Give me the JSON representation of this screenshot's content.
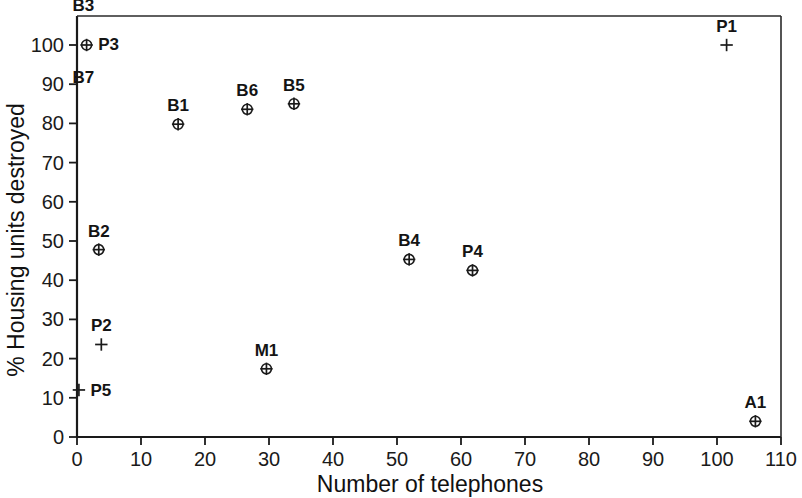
{
  "chart_data": {
    "type": "scatter",
    "title": "",
    "xlabel": "Number of telephones",
    "ylabel": "% Housing units destroyed",
    "xlim": [
      0,
      110
    ],
    "ylim": [
      0,
      105
    ],
    "xticks": [
      "0",
      "10",
      "20",
      "30",
      "40",
      "50",
      "60",
      "70",
      "80",
      "90",
      "100",
      "110"
    ],
    "xtick_values": [
      0,
      10,
      20,
      30,
      40,
      50,
      60,
      70,
      80,
      90,
      100,
      110
    ],
    "yticks": [
      "0",
      "10",
      "20",
      "30",
      "40",
      "50",
      "60",
      "70",
      "80",
      "90",
      "100"
    ],
    "ytick_values": [
      0,
      10,
      20,
      30,
      40,
      50,
      60,
      70,
      80,
      90,
      100
    ],
    "grid": false,
    "legend": "none",
    "marker_types": {
      "circle_plus": "circle with plus inside",
      "plus": "plus sign"
    },
    "points": [
      {
        "label": "B3",
        "x": 1.0,
        "y": 102.0,
        "marker": "none",
        "label_dx": 0,
        "label_dy": -26
      },
      {
        "label": "P3",
        "x": 1.5,
        "y": 100.0,
        "marker": "circle_plus",
        "label_dx": 22,
        "label_dy": 5
      },
      {
        "label": "B7",
        "x": 1.0,
        "y": 96.0,
        "marker": "none",
        "label_dx": 0,
        "label_dy": 22
      },
      {
        "label": "B1",
        "x": 15.8,
        "y": 79.8,
        "marker": "circle_plus",
        "label_dx": 0,
        "label_dy": -13
      },
      {
        "label": "B6",
        "x": 26.6,
        "y": 83.6,
        "marker": "circle_plus",
        "label_dx": 0,
        "label_dy": -13
      },
      {
        "label": "B5",
        "x": 33.9,
        "y": 85.0,
        "marker": "circle_plus",
        "label_dx": 0,
        "label_dy": -13
      },
      {
        "label": "P1",
        "x": 101.5,
        "y": 100.0,
        "marker": "plus",
        "label_dx": 0,
        "label_dy": -13
      },
      {
        "label": "B2",
        "x": 3.4,
        "y": 47.8,
        "marker": "circle_plus",
        "label_dx": 0,
        "label_dy": -13
      },
      {
        "label": "B4",
        "x": 51.9,
        "y": 45.3,
        "marker": "circle_plus",
        "label_dx": 0,
        "label_dy": -13
      },
      {
        "label": "P4",
        "x": 61.8,
        "y": 42.5,
        "marker": "circle_plus",
        "label_dx": 0,
        "label_dy": -13
      },
      {
        "label": "P2",
        "x": 3.8,
        "y": 23.6,
        "marker": "plus",
        "label_dx": 0,
        "label_dy": -13
      },
      {
        "label": "M1",
        "x": 29.6,
        "y": 17.4,
        "marker": "circle_plus",
        "label_dx": 0,
        "label_dy": -13
      },
      {
        "label": "P5",
        "x": 0.3,
        "y": 12.0,
        "marker": "plus",
        "label_dx": 22,
        "label_dy": 6
      },
      {
        "label": "A1",
        "x": 106.0,
        "y": 4.0,
        "marker": "circle_plus",
        "label_dx": 0,
        "label_dy": -13
      }
    ]
  },
  "colors": {
    "axis": "#1a1a1a",
    "marker": "#1a1a1a",
    "text": "#111111",
    "background": "#ffffff"
  }
}
